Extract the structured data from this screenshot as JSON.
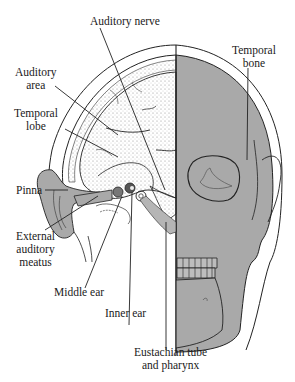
{
  "diagram": {
    "colors": {
      "skull_fill": "#a9a9a9",
      "ear_fill": "#a9a9a9",
      "line": "#222222",
      "brain_stipple": "#888888",
      "background": "#ffffff"
    },
    "labels": {
      "auditory_nerve": "Auditory nerve",
      "auditory_area_1": "Auditory",
      "auditory_area_2": "area",
      "temporal_lobe_1": "Temporal",
      "temporal_lobe_2": "lobe",
      "temporal_bone_1": "Temporal",
      "temporal_bone_2": "bone",
      "pinna": "Pinna",
      "external_meatus_1": "External",
      "external_meatus_2": "auditory",
      "external_meatus_3": "meatus",
      "middle_ear": "Middle ear",
      "inner_ear": "Inner ear",
      "eustachian_1": "Eustachian tube",
      "eustachian_2": "and pharynx"
    }
  }
}
